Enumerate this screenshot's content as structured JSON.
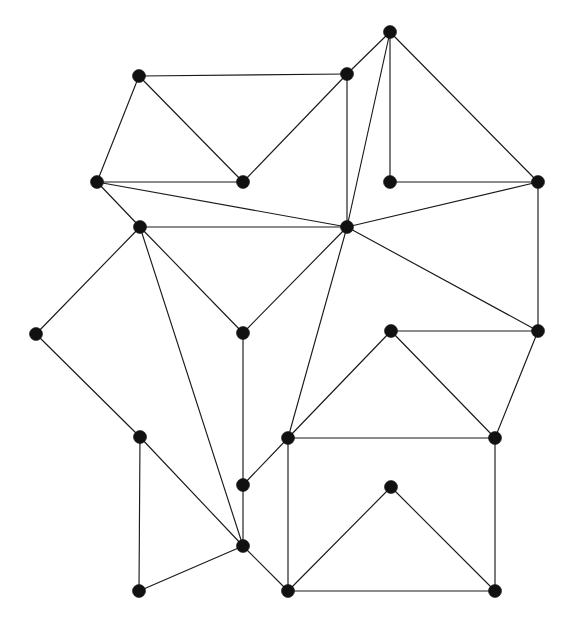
{
  "figure": {
    "background_color": "#ffffff",
    "vertex_color": "#111111",
    "edge_color": "#1a1a1a",
    "vertex_radius": 6.5,
    "edge_width": 1.15,
    "vertex_count": 22,
    "edge_count": 44,
    "width": 567,
    "height": 625
  },
  "chart_data": {
    "type": "scatter",
    "title": "",
    "xlabel": "",
    "ylabel": "",
    "xlim": [
      0,
      567
    ],
    "ylim": [
      0,
      625
    ],
    "grid": false,
    "legend": "none",
    "graph": {
      "directed": false,
      "weighted": false,
      "layout": "straight-line planar embedding",
      "nodes": [
        {
          "id": "n0",
          "label": "",
          "x": 390,
          "y": 32
        },
        {
          "id": "n1",
          "label": "",
          "x": 139,
          "y": 76
        },
        {
          "id": "n2",
          "label": "",
          "x": 347,
          "y": 74
        },
        {
          "id": "n3",
          "label": "",
          "x": 97,
          "y": 182
        },
        {
          "id": "n4",
          "label": "",
          "x": 243,
          "y": 182
        },
        {
          "id": "n5",
          "label": "",
          "x": 390,
          "y": 182
        },
        {
          "id": "n6",
          "label": "",
          "x": 538,
          "y": 182
        },
        {
          "id": "n7",
          "label": "",
          "x": 347,
          "y": 227
        },
        {
          "id": "n8",
          "label": "",
          "x": 140,
          "y": 227
        },
        {
          "id": "n9",
          "label": "",
          "x": 36,
          "y": 334
        },
        {
          "id": "n10",
          "label": "",
          "x": 243,
          "y": 333
        },
        {
          "id": "n11",
          "label": "",
          "x": 391,
          "y": 331
        },
        {
          "id": "n12",
          "label": "",
          "x": 538,
          "y": 331
        },
        {
          "id": "n13",
          "label": "",
          "x": 140,
          "y": 437
        },
        {
          "id": "n14",
          "label": "",
          "x": 288,
          "y": 438
        },
        {
          "id": "n15",
          "label": "",
          "x": 495,
          "y": 438
        },
        {
          "id": "n16",
          "label": "",
          "x": 243,
          "y": 485
        },
        {
          "id": "n17",
          "label": "",
          "x": 391,
          "y": 487
        },
        {
          "id": "n18",
          "label": "",
          "x": 243,
          "y": 546
        },
        {
          "id": "n19",
          "label": "",
          "x": 139,
          "y": 591
        },
        {
          "id": "n20",
          "label": "",
          "x": 288,
          "y": 591
        },
        {
          "id": "n21",
          "label": "",
          "x": 495,
          "y": 591
        }
      ],
      "edges": [
        {
          "source": "n1",
          "target": "n2"
        },
        {
          "source": "n1",
          "target": "n3"
        },
        {
          "source": "n1",
          "target": "n4"
        },
        {
          "source": "n3",
          "target": "n4"
        },
        {
          "source": "n3",
          "target": "n7"
        },
        {
          "source": "n3",
          "target": "n8"
        },
        {
          "source": "n4",
          "target": "n2"
        },
        {
          "source": "n2",
          "target": "n0"
        },
        {
          "source": "n2",
          "target": "n7"
        },
        {
          "source": "n0",
          "target": "n5"
        },
        {
          "source": "n0",
          "target": "n6"
        },
        {
          "source": "n0",
          "target": "n7"
        },
        {
          "source": "n5",
          "target": "n6"
        },
        {
          "source": "n6",
          "target": "n7"
        },
        {
          "source": "n6",
          "target": "n12"
        },
        {
          "source": "n7",
          "target": "n8"
        },
        {
          "source": "n7",
          "target": "n10"
        },
        {
          "source": "n7",
          "target": "n12"
        },
        {
          "source": "n7",
          "target": "n14"
        },
        {
          "source": "n8",
          "target": "n9"
        },
        {
          "source": "n8",
          "target": "n10"
        },
        {
          "source": "n8",
          "target": "n18"
        },
        {
          "source": "n9",
          "target": "n13"
        },
        {
          "source": "n10",
          "target": "n16"
        },
        {
          "source": "n11",
          "target": "n12"
        },
        {
          "source": "n11",
          "target": "n14"
        },
        {
          "source": "n11",
          "target": "n15"
        },
        {
          "source": "n12",
          "target": "n15"
        },
        {
          "source": "n13",
          "target": "n18"
        },
        {
          "source": "n13",
          "target": "n19"
        },
        {
          "source": "n14",
          "target": "n15"
        },
        {
          "source": "n14",
          "target": "n16"
        },
        {
          "source": "n14",
          "target": "n20"
        },
        {
          "source": "n15",
          "target": "n21"
        },
        {
          "source": "n16",
          "target": "n18"
        },
        {
          "source": "n17",
          "target": "n20"
        },
        {
          "source": "n17",
          "target": "n21"
        },
        {
          "source": "n18",
          "target": "n19"
        },
        {
          "source": "n18",
          "target": "n20"
        },
        {
          "source": "n20",
          "target": "n21"
        }
      ]
    }
  }
}
